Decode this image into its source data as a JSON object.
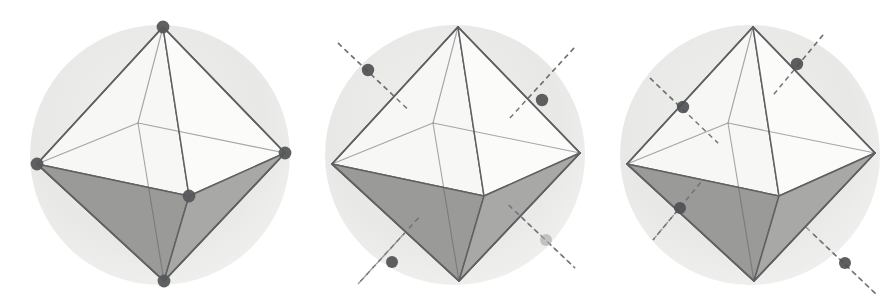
{
  "figure": {
    "background_color": "#ffffff",
    "width": 886,
    "height": 308,
    "panel_count": 3
  },
  "style": {
    "sphere_fill": "#e8e8e6",
    "sphere_fill_inner": "#efefed",
    "edge_color": "#5f6163",
    "edge_width": 1.5,
    "face_top_left": "#c9c9c7",
    "face_top_right": "#bdbdbb",
    "face_front_left": "#f7f7f6",
    "face_front_right": "#fbfbfa",
    "face_bottom_left": "#9a9a98",
    "face_bottom_right": "#a8a8a6",
    "face_inner_light": "#d4d4d2",
    "vertex_dot_color": "#55575a",
    "axis_dot_color": "#4e5053",
    "axis_dot_color_faint": "#a9abad",
    "dashed_axis_color": "#6e7072",
    "dash_pattern": "5,4"
  },
  "panels": [
    {
      "name": "panel-vertices",
      "caption": "",
      "center_x": 160,
      "shows": "vertices",
      "sphere": {
        "cx": 160,
        "cy": 155,
        "r": 130
      },
      "vertices": [
        {
          "id": "top",
          "x": 163,
          "y": 27,
          "label": "top vertex",
          "visible_dot": true
        },
        {
          "id": "bottom",
          "x": 164,
          "y": 281,
          "label": "bottom vertex",
          "visible_dot": true
        },
        {
          "id": "left",
          "x": 37,
          "y": 164,
          "label": "left vertex",
          "visible_dot": true
        },
        {
          "id": "right",
          "x": 285,
          "y": 153,
          "label": "right vertex",
          "visible_dot": true
        },
        {
          "id": "front",
          "x": 189,
          "y": 196,
          "label": "front vertex",
          "visible_dot": true
        },
        {
          "id": "back",
          "x": 138,
          "y": 123,
          "label": "back vertex",
          "visible_dot": false
        }
      ],
      "axes": []
    },
    {
      "name": "panel-axes-set-a",
      "caption": "",
      "center_x": 455,
      "shows": "three-fold-axes-set-a",
      "sphere": {
        "cx": 455,
        "cy": 155,
        "r": 130
      },
      "vertices": [
        {
          "id": "top",
          "x": 458,
          "y": 27,
          "label": "top vertex",
          "visible_dot": false
        },
        {
          "id": "bottom",
          "x": 459,
          "y": 281,
          "label": "bottom vertex",
          "visible_dot": false
        },
        {
          "id": "left",
          "x": 332,
          "y": 164,
          "label": "left vertex",
          "visible_dot": false
        },
        {
          "id": "right",
          "x": 580,
          "y": 153,
          "label": "right vertex",
          "visible_dot": false
        },
        {
          "id": "front",
          "x": 484,
          "y": 196,
          "label": "front vertex",
          "visible_dot": false
        },
        {
          "id": "back",
          "x": 433,
          "y": 123,
          "label": "back vertex",
          "visible_dot": false
        }
      ],
      "axes": [
        {
          "id": "axis-a1",
          "x1": 338,
          "y1": 43,
          "x2": 575,
          "y2": 268,
          "dot_x": 368,
          "dot_y": 70,
          "dot_x2": 546,
          "dot_y2": 240,
          "dot2_faint": true,
          "label": "three-fold axis 1"
        },
        {
          "id": "axis-a2",
          "x1": 574,
          "y1": 48,
          "x2": 358,
          "y2": 284,
          "dot_x": 542,
          "dot_y": 100,
          "dot_x2": 392,
          "dot_y2": 262,
          "dot2_faint": false,
          "label": "three-fold axis 2"
        }
      ]
    },
    {
      "name": "panel-axes-set-b",
      "caption": "",
      "center_x": 750,
      "shows": "three-fold-axes-set-b",
      "sphere": {
        "cx": 750,
        "cy": 155,
        "r": 130
      },
      "vertices": [
        {
          "id": "top",
          "x": 753,
          "y": 27,
          "label": "top vertex",
          "visible_dot": false
        },
        {
          "id": "bottom",
          "x": 754,
          "y": 281,
          "label": "bottom vertex",
          "visible_dot": false
        },
        {
          "id": "left",
          "x": 627,
          "y": 164,
          "label": "left vertex",
          "visible_dot": false
        },
        {
          "id": "right",
          "x": 875,
          "y": 153,
          "label": "right vertex",
          "visible_dot": false
        },
        {
          "id": "front",
          "x": 779,
          "y": 196,
          "label": "front vertex",
          "visible_dot": false
        },
        {
          "id": "back",
          "x": 728,
          "y": 123,
          "label": "back vertex",
          "visible_dot": false
        }
      ],
      "axes": [
        {
          "id": "axis-b1",
          "x1": 650,
          "y1": 78,
          "x2": 877,
          "y2": 295,
          "dot_x": 683,
          "dot_y": 107,
          "dot_x2": 845,
          "dot_y2": 263,
          "dot2_faint": false,
          "label": "three-fold axis 3"
        },
        {
          "id": "axis-b2",
          "x1": 823,
          "y1": 35,
          "x2": 653,
          "y2": 240,
          "dot_x": 797,
          "dot_y": 64,
          "dot_x2": 680,
          "dot_y2": 208,
          "dot2_faint": false,
          "label": "three-fold axis 4"
        }
      ]
    }
  ]
}
